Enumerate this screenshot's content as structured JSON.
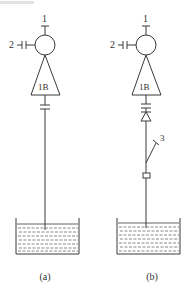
{
  "figure": {
    "header_fragment_color": "#d8d8d8",
    "line_color": "#3a3a3a",
    "panels": [
      {
        "id": "a",
        "caption": "(a)",
        "labels": {
          "terminal_top": "1",
          "terminal_side": "2",
          "body": "1B"
        },
        "components": [
          "terminal-1",
          "side-capacitor-2",
          "circle-head",
          "triangle-body-1B",
          "coupling-capacitor",
          "probe-line",
          "liquid-tank"
        ]
      },
      {
        "id": "b",
        "caption": "(b)",
        "labels": {
          "terminal_top": "1",
          "terminal_side": "2",
          "body": "1B",
          "switch": "3"
        },
        "components": [
          "terminal-1",
          "side-capacitor-2",
          "circle-head",
          "triangle-body-1B",
          "coupling-capacitor",
          "diode",
          "switch-3",
          "resistor",
          "probe-line",
          "liquid-tank"
        ]
      }
    ]
  }
}
